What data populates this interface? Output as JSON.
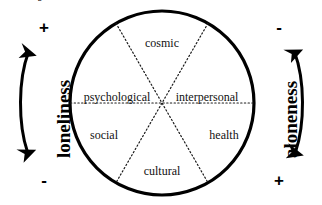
{
  "diagram": {
    "type": "six-sector-circle-with-bipolar-axes",
    "circle": {
      "center_x": 162,
      "center_y": 103,
      "radius": 92,
      "stroke_color": "#000000",
      "stroke_width": 3.2,
      "fill_color": "#ffffff"
    },
    "divider_style": {
      "color": "#1a1a1a",
      "pattern": "dotted",
      "width": 1.1
    },
    "sectors": [
      {
        "id": "cosmic",
        "label": "cosmic",
        "position": "top",
        "x": 162,
        "y": 43
      },
      {
        "id": "interpersonal",
        "label": "interpersonal",
        "position": "middle-right",
        "x": 207,
        "y": 97
      },
      {
        "id": "health",
        "label": "health",
        "position": "bottom-right",
        "x": 224,
        "y": 135
      },
      {
        "id": "cultural",
        "label": "cultural",
        "position": "bottom",
        "x": 162,
        "y": 171
      },
      {
        "id": "social",
        "label": "social",
        "position": "bottom-left",
        "x": 104,
        "y": 135
      },
      {
        "id": "psychological",
        "label": "psychological",
        "position": "middle-left",
        "x": 117,
        "y": 97
      }
    ],
    "axes": [
      {
        "id": "loneliness",
        "label": "loneliness",
        "side": "left",
        "top_sign": "+",
        "bottom_sign": "-",
        "arrow": "double-headed",
        "arrow_bow": "left",
        "color": "#000000"
      },
      {
        "id": "aloneness",
        "label": "aloneness",
        "side": "right",
        "top_sign": "-",
        "bottom_sign": "+",
        "arrow": "double-headed",
        "arrow_bow": "right",
        "color": "#000000"
      }
    ],
    "cropped_artifact": "g"
  }
}
